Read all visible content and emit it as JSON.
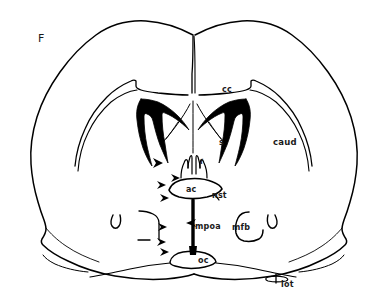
{
  "figure": {
    "panel_letter": "F",
    "kind": "coronal-brain-section-line-drawing",
    "background_color": "#ffffff",
    "ink_color": "#000000"
  },
  "labels": [
    {
      "id": "panel",
      "text": "F",
      "x": 38,
      "y": 33,
      "size": "panel-letter",
      "role": "panel-letter"
    },
    {
      "id": "cc",
      "text": "cc",
      "x": 222,
      "y": 86,
      "size": "lbl-sm",
      "role": "structure-label"
    },
    {
      "id": "caud",
      "text": "caud",
      "x": 273,
      "y": 138,
      "size": "lbl-md",
      "role": "structure-label"
    },
    {
      "id": "s",
      "text": "s",
      "x": 219,
      "y": 139,
      "size": "lbl-sm",
      "role": "structure-label"
    },
    {
      "id": "f",
      "text": "f",
      "x": 200,
      "y": 159,
      "size": "lbl-xs",
      "role": "structure-label"
    },
    {
      "id": "ac",
      "text": "ac",
      "x": 186,
      "y": 186,
      "size": "lbl-sm",
      "role": "structure-label"
    },
    {
      "id": "nst",
      "text": "nst",
      "x": 212,
      "y": 192,
      "size": "lbl-sm",
      "role": "structure-label"
    },
    {
      "id": "mpoa",
      "text": "mpoa",
      "x": 195,
      "y": 223,
      "size": "lbl-sm",
      "role": "structure-label"
    },
    {
      "id": "mfb",
      "text": "mfb",
      "x": 232,
      "y": 224,
      "size": "lbl-sm",
      "role": "structure-label"
    },
    {
      "id": "oc",
      "text": "oc",
      "x": 198,
      "y": 257,
      "size": "lbl-sm",
      "role": "structure-label"
    },
    {
      "id": "lot",
      "text": "lot",
      "x": 281,
      "y": 281,
      "size": "lbl-sm",
      "role": "structure-label"
    }
  ],
  "legend_expansions": {
    "cc": "corpus callosum",
    "caud": "caudate",
    "s": "septum",
    "f": "fornix",
    "ac": "anterior commissure",
    "nst": "nucleus of the stria terminalis",
    "mpoa": "medial preoptic area",
    "mfb": "medial forebrain bundle",
    "oc": "optic chiasm",
    "lot": "lateral olfactory tract"
  },
  "markers": {
    "arrowheads_right_pointing": 7,
    "arrowheads_left_pointing": 1,
    "tick_marks": 1
  }
}
